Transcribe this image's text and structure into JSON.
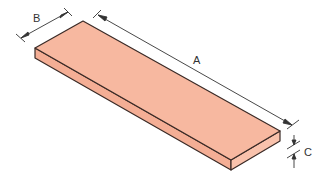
{
  "diagram": {
    "type": "isometric-dimension-drawing",
    "colors": {
      "top_face": "#f7b8a0",
      "side_face": "#f4ae95",
      "front_face": "#f9c2ac",
      "edge": "#3a2a26",
      "dimension_line": "#333333",
      "background": "#ffffff"
    },
    "dimensions": [
      {
        "id": "A",
        "label": "A",
        "meaning": "length"
      },
      {
        "id": "B",
        "label": "B",
        "meaning": "width"
      },
      {
        "id": "C",
        "label": "C",
        "meaning": "thickness"
      }
    ]
  }
}
